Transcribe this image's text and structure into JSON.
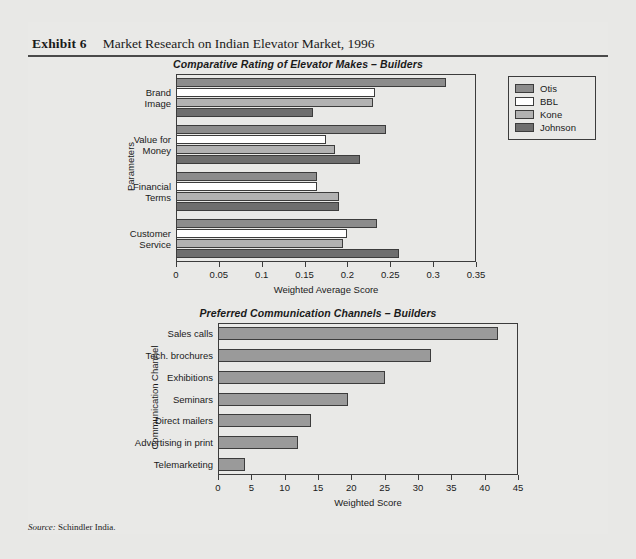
{
  "exhibit": {
    "label": "Exhibit 6",
    "title": "Market Research on Indian Elevator Market, 1996",
    "source_prefix": "Source:",
    "source_text": "Schindler India."
  },
  "colors": {
    "page_bg": "#e8e8e6",
    "frame": "#3c3c3c",
    "otis": "#8c8c8c",
    "bbl": "#ffffff",
    "kone": "#b2b2b2",
    "johnson": "#6e6e6e",
    "chart2_bar": "#9a9a9a"
  },
  "chart_data": [
    {
      "type": "bar",
      "orientation": "horizontal",
      "title": "Comparative Rating of Elevator Makes – Builders",
      "xlabel": "Weighted Average Score",
      "ylabel": "Parameters",
      "xlim": [
        0,
        0.35
      ],
      "xticks": [
        "0",
        "0.05",
        "0.1",
        "0.15",
        "0.2",
        "0.25",
        "0.3",
        "0.35"
      ],
      "xtick_values": [
        0,
        0.05,
        0.1,
        0.15,
        0.2,
        0.25,
        0.3,
        0.35
      ],
      "grid": false,
      "legend_position": "right",
      "categories": [
        "Brand\nImage",
        "Value for\nMoney",
        "Financial\nTerms",
        "Customer\nService"
      ],
      "series": [
        {
          "name": "Otis",
          "color": "#8c8c8c",
          "values": [
            0.315,
            0.245,
            0.165,
            0.235
          ]
        },
        {
          "name": "BBL",
          "color": "#ffffff",
          "values": [
            0.232,
            0.175,
            0.165,
            0.2
          ]
        },
        {
          "name": "Kone",
          "color": "#b2b2b2",
          "values": [
            0.23,
            0.185,
            0.19,
            0.195
          ]
        },
        {
          "name": "Johnson",
          "color": "#6e6e6e",
          "values": [
            0.16,
            0.215,
            0.19,
            0.26
          ]
        }
      ]
    },
    {
      "type": "bar",
      "orientation": "horizontal",
      "title": "Preferred Communication Channels – Builders",
      "xlabel": "Weighted Score",
      "ylabel": "Communication Channel",
      "xlim": [
        0,
        45
      ],
      "xticks": [
        "0",
        "5",
        "10",
        "15",
        "20",
        "25",
        "30",
        "35",
        "40",
        "45"
      ],
      "xtick_values": [
        0,
        5,
        10,
        15,
        20,
        25,
        30,
        35,
        40,
        45
      ],
      "grid": false,
      "legend_position": "none",
      "categories": [
        "Sales calls",
        "Tech. brochures",
        "Exhibitions",
        "Seminars",
        "Direct mailers",
        "Advertising in print",
        "Telemarketing"
      ],
      "values": [
        42,
        32,
        25,
        19.5,
        14,
        12,
        4
      ],
      "bar_color": "#9a9a9a"
    }
  ]
}
